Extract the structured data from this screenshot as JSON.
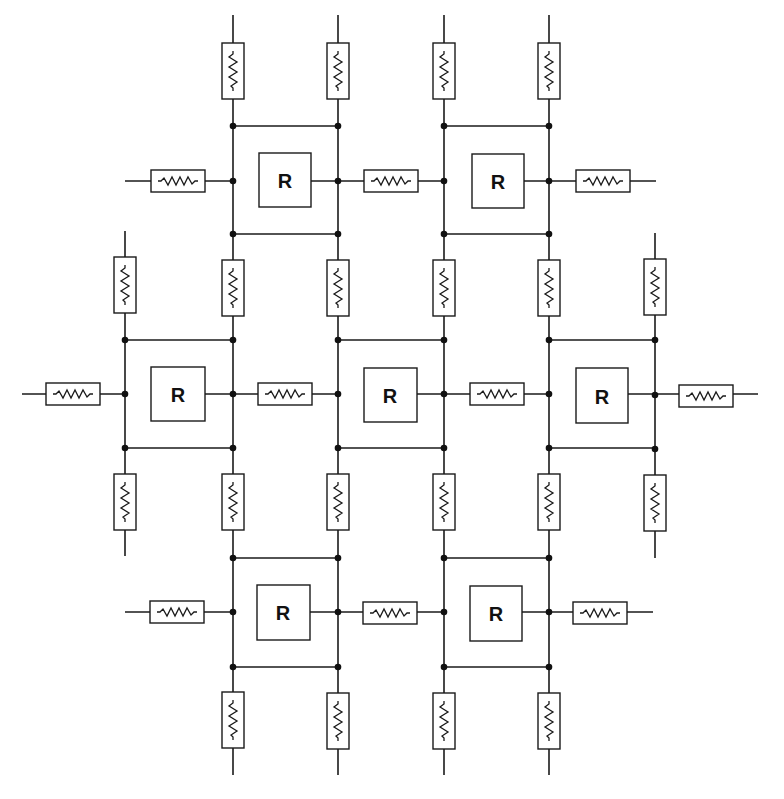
{
  "diagram": {
    "title": "",
    "unit_label": "R",
    "colors": {
      "line": "#1a1a1a",
      "node": "#111111",
      "background": "#ffffff"
    },
    "units": [
      {
        "id": "u-top-left",
        "label": "R",
        "row": 0,
        "col": 0
      },
      {
        "id": "u-top-right",
        "label": "R",
        "row": 0,
        "col": 1
      },
      {
        "id": "u-mid-left",
        "label": "R",
        "row": 1,
        "col": 0
      },
      {
        "id": "u-mid-center",
        "label": "R",
        "row": 1,
        "col": 1
      },
      {
        "id": "u-mid-right",
        "label": "R",
        "row": 1,
        "col": 2
      },
      {
        "id": "u-bottom-left",
        "label": "R",
        "row": 2,
        "col": 0
      },
      {
        "id": "u-bottom-right",
        "label": "R",
        "row": 2,
        "col": 1
      }
    ],
    "resistor_symbol": "zigzag-resistor",
    "node_symbol": "junction-dot"
  }
}
